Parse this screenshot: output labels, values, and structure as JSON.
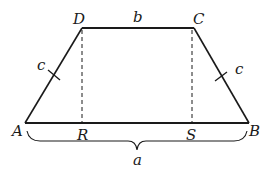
{
  "diagram": {
    "type": "trapezoid",
    "vertices": {
      "A": {
        "label": "A",
        "x": 25,
        "y": 123
      },
      "B": {
        "label": "B",
        "x": 249,
        "y": 123
      },
      "C": {
        "label": "C",
        "x": 194,
        "y": 28
      },
      "D": {
        "label": "D",
        "x": 82,
        "y": 28
      }
    },
    "feet": {
      "R": {
        "label": "R",
        "x": 82,
        "y": 123
      },
      "S": {
        "label": "S",
        "x": 192,
        "y": 123
      }
    },
    "side_labels": {
      "top": "b",
      "left": "c",
      "right": "c",
      "bottom_brace": "a"
    },
    "colors": {
      "stroke": "#1a1a1a",
      "background": "#ffffff"
    }
  }
}
